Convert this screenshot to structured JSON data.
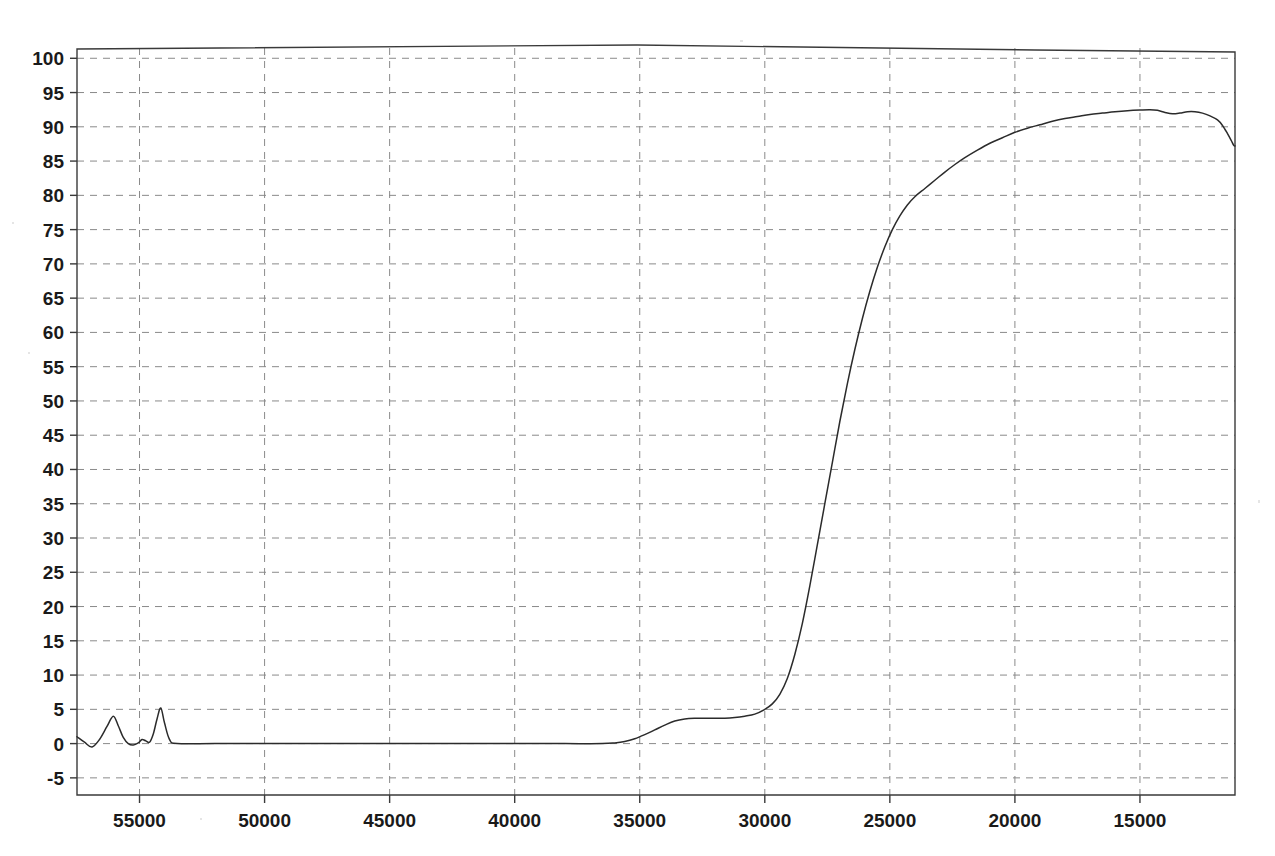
{
  "chart_data": {
    "type": "line",
    "title": "",
    "subtitle": "",
    "xlabel": "",
    "ylabel": "",
    "xlim": [
      57500,
      11200
    ],
    "ylim": [
      -7.5,
      101.5
    ],
    "x_axis_reversed": true,
    "grid": true,
    "legend": "none",
    "legend_entries": [],
    "annotations": [],
    "x_ticks": [
      55000,
      50000,
      45000,
      40000,
      35000,
      30000,
      25000,
      20000,
      15000
    ],
    "x_tick_labels": [
      "55000",
      "50000",
      "45000",
      "40000",
      "35000",
      "30000",
      "25000",
      "20000",
      "15000"
    ],
    "y_ticks": [
      -5,
      0,
      5,
      10,
      15,
      20,
      25,
      30,
      35,
      40,
      45,
      50,
      55,
      60,
      65,
      70,
      75,
      80,
      85,
      90,
      95,
      100
    ],
    "y_tick_labels": [
      "-5",
      "0",
      "5",
      "10",
      "15",
      "20",
      "25",
      "30",
      "35",
      "40",
      "45",
      "50",
      "55",
      "60",
      "65",
      "70",
      "75",
      "80",
      "85",
      "90",
      "95",
      "100"
    ],
    "series": [
      {
        "name": "transmittance",
        "color": "#2b2b2b",
        "x": [
          57500,
          57200,
          56900,
          56600,
          56300,
          56050,
          55850,
          55650,
          55450,
          55250,
          55050,
          54900,
          54750,
          54600,
          54450,
          54300,
          54150,
          54000,
          53800,
          53500,
          52000,
          50000,
          48000,
          46000,
          44000,
          42000,
          40000,
          38000,
          36500,
          36000,
          35600,
          35200,
          34800,
          34400,
          34000,
          33600,
          33200,
          32800,
          32400,
          32000,
          31600,
          31200,
          30800,
          30400,
          30000,
          29700,
          29400,
          29100,
          28800,
          28500,
          28200,
          27900,
          27600,
          27300,
          27000,
          26700,
          26400,
          26100,
          25800,
          25500,
          25200,
          24900,
          24600,
          24300,
          24000,
          23600,
          23200,
          22800,
          22400,
          22000,
          21500,
          21000,
          20500,
          20000,
          19500,
          19000,
          18500,
          18000,
          17500,
          17000,
          16500,
          16000,
          15500,
          15000,
          14600,
          14300,
          14000,
          13700,
          13400,
          13100,
          12800,
          12500,
          12200,
          11900,
          11700,
          11500,
          11350,
          11250,
          11200
        ],
        "y": [
          1.0,
          0.2,
          -0.5,
          0.6,
          2.5,
          4.0,
          2.6,
          0.9,
          0.0,
          -0.2,
          0.1,
          0.6,
          0.4,
          0.2,
          1.4,
          3.6,
          5.2,
          3.0,
          0.6,
          0.0,
          0.0,
          0.0,
          0.0,
          0.0,
          0.0,
          0.0,
          0.0,
          0.0,
          0.0,
          0.1,
          0.3,
          0.7,
          1.3,
          2.0,
          2.7,
          3.3,
          3.6,
          3.7,
          3.7,
          3.7,
          3.7,
          3.8,
          4.0,
          4.3,
          5.0,
          5.8,
          7.2,
          9.5,
          13.0,
          17.5,
          23.0,
          29.0,
          35.0,
          41.0,
          47.0,
          52.5,
          57.5,
          62.0,
          66.0,
          69.5,
          72.5,
          75.0,
          77.0,
          78.6,
          79.8,
          81.0,
          82.2,
          83.4,
          84.5,
          85.5,
          86.6,
          87.6,
          88.4,
          89.2,
          89.8,
          90.3,
          90.8,
          91.2,
          91.5,
          91.8,
          92.0,
          92.2,
          92.35,
          92.45,
          92.5,
          92.4,
          92.1,
          91.9,
          92.0,
          92.2,
          92.2,
          92.0,
          91.6,
          91.0,
          90.2,
          89.0,
          88.0,
          87.3,
          87.2
        ]
      },
      {
        "name": "top-frame-baseline",
        "color": "#3a3a3a",
        "x": [],
        "y": []
      }
    ]
  },
  "plot": {
    "background_color": "#ffffff",
    "grid_color": "#8a8a8a",
    "frame_color": "#3a3a3a",
    "curve_color": "#2b2b2b"
  }
}
